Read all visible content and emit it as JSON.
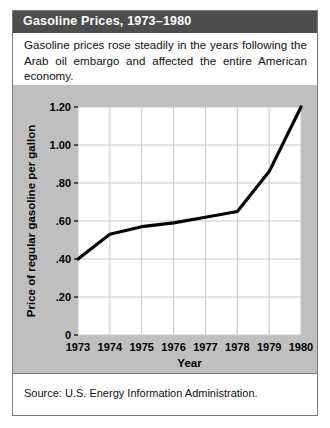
{
  "figure": {
    "title": "Gasoline Prices, 1973–1980",
    "description": "Gasoline prices rose steadily in the years following the Arab oil embargo and affected the entire American economy.",
    "source": "Source: U.S. Energy Information Administration.",
    "colors": {
      "title_bar": "#4d4d4d",
      "title_text": "#ffffff",
      "chart_background": "#bfbfbf",
      "plot_background": "#ffffff",
      "gridline": "#c8c8c8",
      "line": "#000000",
      "border": "#7a7a7a"
    }
  },
  "chart_data": {
    "type": "line",
    "title": "Gasoline Prices, 1973–1980",
    "xlabel": "Year",
    "ylabel": "Price of regular gasoline per gallon",
    "categories": [
      "1973",
      "1974",
      "1975",
      "1976",
      "1977",
      "1978",
      "1979",
      "1980"
    ],
    "x": [
      1973,
      1974,
      1975,
      1976,
      1977,
      1978,
      1979,
      1980
    ],
    "values": [
      0.4,
      0.53,
      0.57,
      0.59,
      0.62,
      0.65,
      0.86,
      1.2
    ],
    "xlim": [
      1973,
      1980
    ],
    "ylim": [
      0,
      1.2
    ],
    "ytick_values": [
      0,
      0.2,
      0.4,
      0.6,
      0.8,
      1.0,
      1.2
    ],
    "ytick_labels": [
      "0",
      ".20",
      ".40",
      ".60",
      ".80",
      "1.00",
      "1.20"
    ],
    "xtick_labels": [
      "1973",
      "1974",
      "1975",
      "1976",
      "1977",
      "1978",
      "1979",
      "1980"
    ],
    "grid": true,
    "legend": false,
    "series": [
      {
        "name": "Price of regular gasoline per gallon",
        "values": [
          0.4,
          0.53,
          0.57,
          0.59,
          0.62,
          0.65,
          0.86,
          1.2
        ]
      }
    ]
  }
}
